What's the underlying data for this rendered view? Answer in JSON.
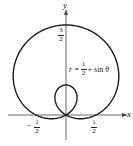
{
  "chart_data": {
    "type": "line",
    "kind": "polar-curve",
    "title": "",
    "equation": "r = 1/2 + sin θ",
    "curve_label": {
      "lhs": "r =",
      "num": "1",
      "den": "2",
      "rhs": "+ sin θ"
    },
    "xlabel": "x",
    "ylabel": "y",
    "theta_range": [
      0,
      6.283185
    ],
    "xlim": [
      -1.3,
      1.3
    ],
    "ylim": [
      -0.3,
      1.8
    ],
    "x_ticks": [
      {
        "value": -0.5,
        "sign": "−",
        "num": "1",
        "den": "2"
      },
      {
        "value": 0.5,
        "sign": "",
        "num": "1",
        "den": "2"
      }
    ],
    "y_ticks": [
      {
        "value": 1.5,
        "num": "3",
        "den": "2"
      }
    ],
    "grid": false,
    "legend": null,
    "line_color": "#1a1a1a",
    "axis_color": "#444444"
  }
}
